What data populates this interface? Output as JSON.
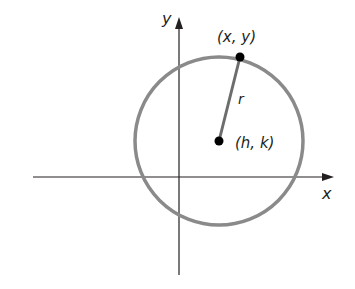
{
  "diagram": {
    "axes": {
      "x_label": "x",
      "y_label": "y"
    },
    "center_label": "(h, k)",
    "point_label": "(x, y)",
    "radius_label": "r",
    "colors": {
      "circle": "#8a8a8a",
      "radius_line": "#6d6d6d",
      "axes": "#231f20",
      "points": "#000000"
    }
  }
}
